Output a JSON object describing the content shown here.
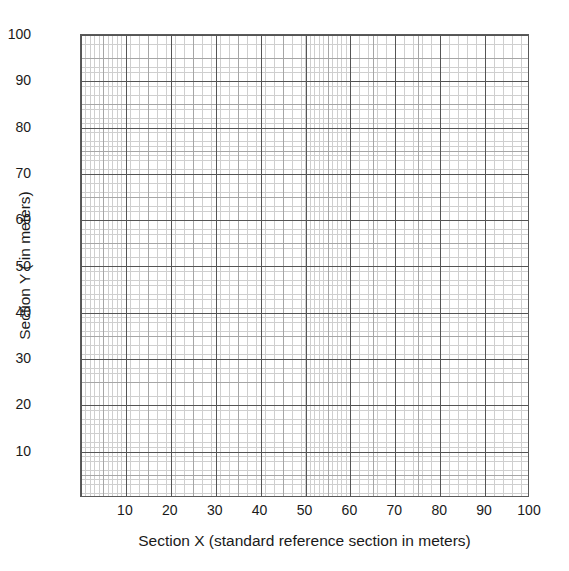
{
  "figure": {
    "background_color": "#ffffff",
    "ink_color": "#1a1a1a"
  },
  "chart_data": {
    "type": "scatter",
    "title": "",
    "subtitle": "",
    "xlabel": "Section X (standard reference section in meters)",
    "ylabel": "Section Y ( in meters)",
    "xlim": [
      0,
      100
    ],
    "ylim": [
      0,
      100
    ],
    "x_tick_labels": [
      "10",
      "20",
      "30",
      "40",
      "50",
      "60",
      "70",
      "80",
      "90",
      "100"
    ],
    "x_tick_values": [
      10,
      20,
      30,
      40,
      50,
      60,
      70,
      80,
      90,
      100
    ],
    "y_tick_labels": [
      "10",
      "20",
      "30",
      "40",
      "50",
      "60",
      "70",
      "80",
      "90",
      "100"
    ],
    "y_tick_values": [
      10,
      20,
      30,
      40,
      50,
      60,
      70,
      80,
      90,
      100
    ],
    "series": [],
    "values": [],
    "categories": [],
    "annotations": [],
    "legend": {
      "entries": [],
      "position": "none"
    },
    "grid": {
      "enabled": true,
      "style": "graph-paper",
      "minor_step": 1,
      "medium_step": 5,
      "major_step": 10,
      "minor_color": "#cfcfcf",
      "medium_color": "#a6a6a6",
      "major_color": "#555555",
      "border_color": "#5a5a5a"
    }
  }
}
